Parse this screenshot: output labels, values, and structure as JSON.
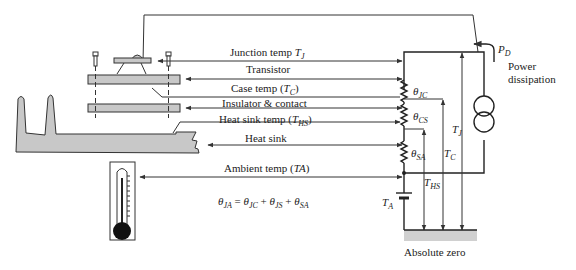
{
  "diagram": {
    "labels": {
      "junction_temp": "Junction temp ",
      "junction_sym": "T",
      "junction_sub": "J",
      "transistor": "Transistor",
      "case_temp": "Case temp (",
      "case_sym": "T",
      "case_sub": "C",
      "case_close": ")",
      "insulator": "Insulator & contact",
      "heatsink_temp": "Heat sink temp (",
      "heatsink_sym": "T",
      "heatsink_sub": "HS",
      "heatsink_close": ")",
      "heatsink": "Heat sink",
      "ambient_temp": "Ambient temp (",
      "ambient_sym": "TA",
      "ambient_close": ")",
      "power_sym": "P",
      "power_sub": "D",
      "power_line1": "Power",
      "power_line2": "dissipation",
      "absolute_zero": "Absolute zero"
    },
    "resistors": [
      {
        "sym": "θ",
        "sub": "JC"
      },
      {
        "sym": "θ",
        "sub": "CS"
      },
      {
        "sym": "θ",
        "sub": "SA"
      }
    ],
    "temperatures": {
      "tj": {
        "sym": "T",
        "sub": "J"
      },
      "tc": {
        "sym": "T",
        "sub": "C"
      },
      "ths": {
        "sym": "T",
        "sub": "HS"
      },
      "ta": {
        "sym": "T",
        "sub": "A"
      }
    },
    "equation": {
      "t0": "θ",
      "s0": "JA",
      "eq": " = ",
      "t1": "θ",
      "s1": "JC",
      "p1": " + ",
      "t2": "θ",
      "s2": "JS",
      "p2": " + ",
      "t3": "θ",
      "s3": "SA"
    },
    "colors": {
      "line": "#333333",
      "fill": "#c8c8c8",
      "ground": "#d0d0d0"
    }
  }
}
